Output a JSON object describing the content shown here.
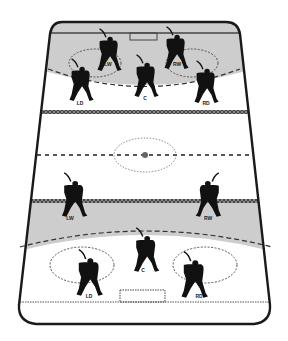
{
  "diagram": {
    "colors": {
      "ice": "#ffffff",
      "zone_shade": "#cfcfcf",
      "boards": "#1a1a1a",
      "line": "#555555",
      "player": "#111111"
    },
    "top_zone": {
      "players": [
        {
          "label": "LW",
          "x": 108,
          "y": 52
        },
        {
          "label": "RW",
          "x": 175,
          "y": 50
        },
        {
          "label": "C",
          "x": 145,
          "y": 78
        },
        {
          "label": "LD",
          "x": 80,
          "y": 82
        },
        {
          "label": "RD",
          "x": 205,
          "y": 84
        }
      ]
    },
    "neutral_zone": {
      "players": [
        {
          "label": "LW",
          "x": 73,
          "y": 197
        },
        {
          "label": "RW",
          "x": 210,
          "y": 197
        }
      ]
    },
    "bottom_zone": {
      "players": [
        {
          "label": "C",
          "x": 145,
          "y": 252
        },
        {
          "label": "LD",
          "x": 88,
          "y": 275
        },
        {
          "label": "RD",
          "x": 193,
          "y": 277
        }
      ]
    }
  }
}
